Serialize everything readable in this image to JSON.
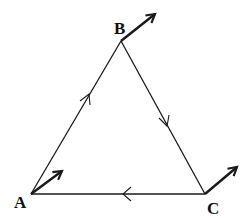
{
  "diagram": {
    "type": "triangle-with-vectors",
    "stroke_color": "#1a1a1a",
    "background": "#ffffff",
    "vertices": [
      {
        "id": "A",
        "label": "A",
        "x": 31,
        "y": 194,
        "label_x": 14,
        "label_y": 208
      },
      {
        "id": "B",
        "label": "B",
        "x": 121,
        "y": 41,
        "label_x": 114,
        "label_y": 34
      },
      {
        "id": "C",
        "label": "C",
        "x": 205,
        "y": 194,
        "label_x": 207,
        "label_y": 214
      }
    ],
    "edges": [
      {
        "from": "A",
        "to": "B",
        "direction_mark": "toward-B"
      },
      {
        "from": "B",
        "to": "C",
        "direction_mark": "toward-C"
      },
      {
        "from": "C",
        "to": "A",
        "direction_mark": "toward-A"
      }
    ],
    "vertex_arrows": [
      {
        "at": "A",
        "x2": 62,
        "y2": 171
      },
      {
        "at": "B",
        "x2": 155,
        "y2": 14
      },
      {
        "at": "C",
        "x2": 237,
        "y2": 167
      }
    ]
  }
}
